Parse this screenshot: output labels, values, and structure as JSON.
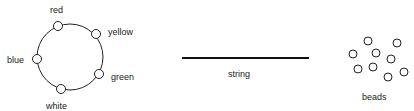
{
  "necklace": {
    "labels": {
      "red": "red",
      "yellow": "yellow",
      "blue": "blue",
      "green": "green",
      "white": "white"
    }
  },
  "string": {
    "label": "string"
  },
  "beads": {
    "label": "beads",
    "count": 9
  },
  "colors": {
    "stroke": "#222222",
    "background": "#ffffff"
  }
}
